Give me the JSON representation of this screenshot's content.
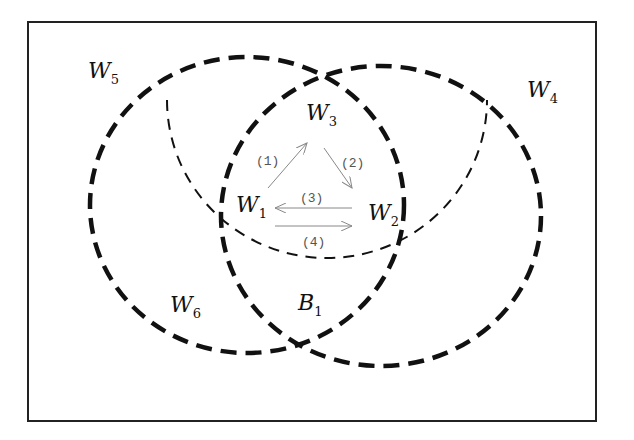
{
  "diagram": {
    "frame": {
      "x": 28,
      "y": 22,
      "width": 568,
      "height": 399
    },
    "regions": [
      {
        "id": "W5",
        "letter": "W",
        "sub": "5",
        "x": 88,
        "y": 78
      },
      {
        "id": "W4",
        "letter": "W",
        "sub": "4",
        "x": 527,
        "y": 97
      },
      {
        "id": "W3",
        "letter": "W",
        "sub": "3",
        "x": 306,
        "y": 120
      },
      {
        "id": "W1",
        "letter": "W",
        "sub": "1",
        "x": 236,
        "y": 212
      },
      {
        "id": "W2",
        "letter": "W",
        "sub": "2",
        "x": 368,
        "y": 220
      },
      {
        "id": "W6",
        "letter": "W",
        "sub": "6",
        "x": 170,
        "y": 312
      },
      {
        "id": "B1",
        "letter": "B",
        "sub": "1",
        "x": 298,
        "y": 310
      }
    ],
    "transitions": [
      {
        "label": "(1)",
        "from": "W1",
        "to": "W3"
      },
      {
        "label": "(2)",
        "from": "W3",
        "to": "W2"
      },
      {
        "label": "(3)",
        "from": "W2",
        "to": "W1"
      },
      {
        "label": "(4)",
        "from": "W1",
        "to": "W2"
      }
    ],
    "colors": {
      "stroke": "#111111",
      "arrow": "#888888",
      "background": "#ffffff"
    }
  }
}
